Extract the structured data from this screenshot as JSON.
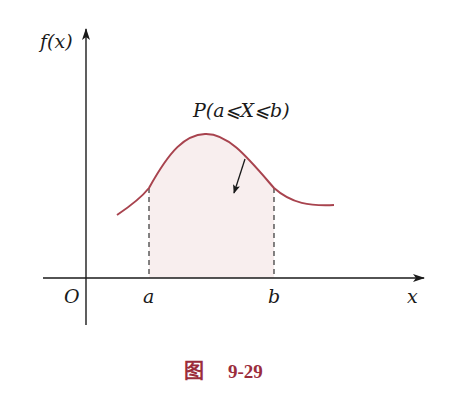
{
  "diagram": {
    "type": "probability-density-diagram",
    "y_axis_label": "f(x)",
    "x_axis_label": "x",
    "origin_label": "O",
    "interval_start_label": "a",
    "interval_end_label": "b",
    "shaded_region_label": "P(a⩽X⩽b)",
    "caption_prefix": "图",
    "caption_number": "9-29",
    "colors": {
      "axis": "#1a1a1a",
      "curve": "#a8434e",
      "shade": "#f8eeee",
      "caption": "#9b2d3c",
      "dashed": "#333333"
    }
  }
}
